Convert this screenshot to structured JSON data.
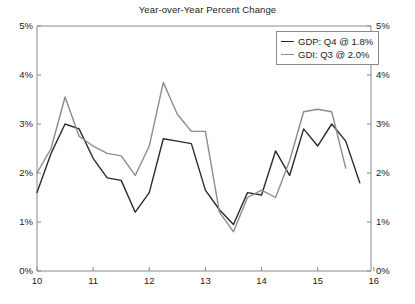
{
  "chart_data": {
    "type": "line",
    "title": "Year-over-Year Percent Change",
    "xlabel": "",
    "ylabel": "",
    "ylim": [
      0,
      5
    ],
    "xlim": [
      2010.0,
      2015.95
    ],
    "grid": false,
    "legend_position": "top-right",
    "y_ticks": [
      "0%",
      "1%",
      "2%",
      "3%",
      "4%",
      "5%"
    ],
    "y_tick_values": [
      0,
      1,
      2,
      3,
      4,
      5
    ],
    "x_ticks": [
      "10",
      "11",
      "12",
      "13",
      "14",
      "15",
      "16"
    ],
    "x_tick_values": [
      2010,
      2011,
      2012,
      2013,
      2014,
      2015,
      2016
    ],
    "dual_axis": true,
    "series": [
      {
        "name": "GDP: Q4 @ 1.8%",
        "short_name": "GDP",
        "color": "#2b2b2b",
        "last_label": "Q4 @ 1.8%",
        "x": [
          2010.0,
          2010.25,
          2010.5,
          2010.75,
          2011.0,
          2011.25,
          2011.5,
          2011.75,
          2012.0,
          2012.25,
          2012.5,
          2012.75,
          2013.0,
          2013.25,
          2013.5,
          2013.75,
          2014.0,
          2014.25,
          2014.5,
          2014.75,
          2015.0,
          2015.25,
          2015.5,
          2015.75
        ],
        "values": [
          1.6,
          2.4,
          3.0,
          2.9,
          2.3,
          1.9,
          1.85,
          1.2,
          1.6,
          2.7,
          2.65,
          2.6,
          1.65,
          1.25,
          0.95,
          1.6,
          1.55,
          2.45,
          1.95,
          2.9,
          2.55,
          3.0,
          2.65,
          1.8
        ]
      },
      {
        "name": "GDI: Q3 @ 2.0%",
        "short_name": "GDI",
        "color": "#8c8c8c",
        "last_label": "Q3 @ 2.0%",
        "x": [
          2010.0,
          2010.25,
          2010.5,
          2010.75,
          2011.0,
          2011.25,
          2011.5,
          2011.75,
          2012.0,
          2012.25,
          2012.5,
          2012.75,
          2013.0,
          2013.25,
          2013.5,
          2013.75,
          2014.0,
          2014.25,
          2014.5,
          2014.75,
          2015.0,
          2015.25,
          2015.5
        ],
        "values": [
          2.0,
          2.5,
          3.55,
          2.75,
          2.55,
          2.4,
          2.35,
          1.95,
          2.55,
          3.85,
          3.2,
          2.85,
          2.85,
          1.2,
          0.8,
          1.5,
          1.65,
          1.5,
          2.25,
          3.25,
          3.3,
          3.25,
          2.1
        ]
      }
    ]
  },
  "legend": {
    "items": [
      {
        "label": "GDP: Q4 @ 1.8%"
      },
      {
        "label": "GDI: Q3 @ 2.0%"
      }
    ]
  }
}
